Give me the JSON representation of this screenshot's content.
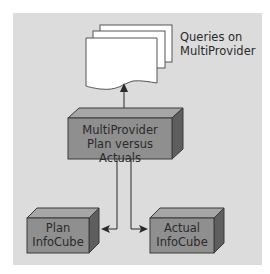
{
  "diagram": {
    "queries_label_line1": "Queries on",
    "queries_label_line2": "MultiProvider",
    "multiprovider": {
      "line1": "MultiProvider",
      "line2": "Plan versus Actuals"
    },
    "plan_cube": {
      "line1": "Plan",
      "line2": "InfoCube"
    },
    "actual_cube": {
      "line1": "Actual",
      "line2": "InfoCube"
    },
    "colors": {
      "panel_bg": "#dcdcdc",
      "cube_front": "#8f8f8f",
      "cube_top": "#a6a6a6",
      "cube_side": "#5e5e5e",
      "document": "#ffffff",
      "line": "#2a2a2a"
    }
  }
}
